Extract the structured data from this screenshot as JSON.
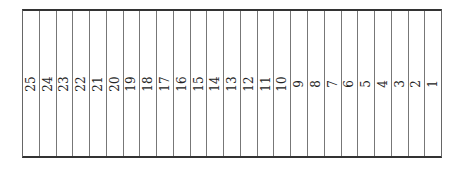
{
  "table": {
    "columns": [
      "25",
      "24",
      "23",
      "22",
      "21",
      "20",
      "19",
      "18",
      "17",
      "16",
      "15",
      "14",
      "13",
      "12",
      "11",
      "10",
      "9",
      "8",
      "7",
      "6",
      "5",
      "4",
      "3",
      "2",
      "1"
    ]
  }
}
